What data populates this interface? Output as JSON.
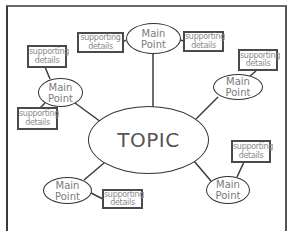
{
  "diagram": {
    "type": "concept-map",
    "center": {
      "label": "TOPIC"
    },
    "main_points": [
      {
        "id": "top",
        "line1": "Main",
        "line2": "Point",
        "details": [
          {
            "line1": "supporting",
            "line2": "details"
          },
          {
            "line1": "supporting",
            "line2": "details"
          }
        ]
      },
      {
        "id": "left",
        "line1": "Main",
        "line2": "Point",
        "details": [
          {
            "line1": "supporting",
            "line2": "details"
          },
          {
            "line1": "supporting",
            "line2": "details"
          }
        ]
      },
      {
        "id": "right",
        "line1": "Main",
        "line2": "Point",
        "details": [
          {
            "line1": "supporting",
            "line2": "details"
          }
        ]
      },
      {
        "id": "bottom-left",
        "line1": "Main",
        "line2": "Point",
        "details": [
          {
            "line1": "supporting",
            "line2": "details"
          }
        ]
      },
      {
        "id": "bottom-right",
        "line1": "Main",
        "line2": "Point",
        "details": [
          {
            "line1": "supporting",
            "line2": "details"
          }
        ]
      }
    ]
  },
  "colors": {
    "line": "#3a3a3a",
    "text": "#7a7a7a",
    "background": "#ffffff"
  }
}
